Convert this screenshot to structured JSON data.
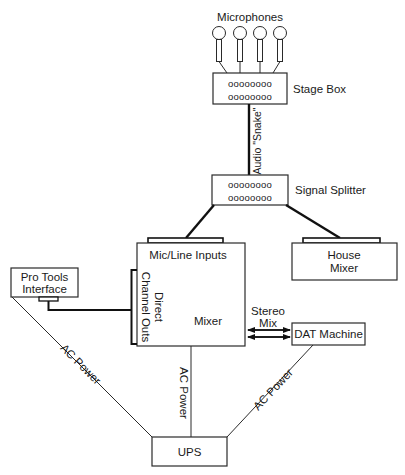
{
  "diagram": {
    "type": "audio-recording-signal-flow",
    "nodes": {
      "microphones": {
        "label": "Microphones",
        "count": 4
      },
      "stage_box": {
        "label": "Stage Box",
        "jack_rows": [
          "oooooooo",
          "oooooooo"
        ]
      },
      "signal_splitter": {
        "label": "Signal Splitter",
        "jack_rows": [
          "oooooooo",
          "oooooooo"
        ]
      },
      "mixer": {
        "label": "Mixer",
        "inputs_label": "Mic/Line Inputs",
        "direct_outs_line1": "Direct",
        "direct_outs_line2": "Channel Outs"
      },
      "house_mixer": {
        "label_line1": "House",
        "label_line2": "Mixer"
      },
      "pro_tools": {
        "label_line1": "Pro Tools",
        "label_line2": "Interface"
      },
      "dat_machine": {
        "label": "DAT Machine"
      },
      "ups": {
        "label": "UPS"
      }
    },
    "edges": [
      {
        "from": "microphones",
        "to": "stage_box",
        "label": ""
      },
      {
        "from": "stage_box",
        "to": "signal_splitter",
        "label": "Audio \"Snake\""
      },
      {
        "from": "signal_splitter",
        "to": "mixer",
        "label": ""
      },
      {
        "from": "signal_splitter",
        "to": "house_mixer",
        "label": ""
      },
      {
        "from": "mixer",
        "to": "pro_tools",
        "label": ""
      },
      {
        "from": "mixer",
        "to": "dat_machine",
        "label_line1": "Stereo",
        "label_line2": "Mix",
        "bidirectional": true
      },
      {
        "from": "ups",
        "to": "pro_tools",
        "label": "AC Power"
      },
      {
        "from": "ups",
        "to": "mixer",
        "label": "AC Power"
      },
      {
        "from": "ups",
        "to": "dat_machine",
        "label": "AC Power"
      }
    ]
  }
}
